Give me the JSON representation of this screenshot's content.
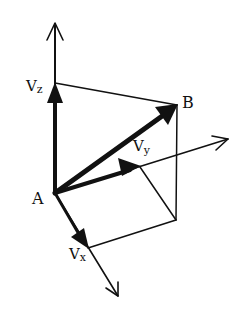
{
  "diagram": {
    "points": {
      "A": {
        "label": "A",
        "x": 55,
        "y": 193
      },
      "B": {
        "label": "B",
        "x": 177,
        "y": 105
      }
    },
    "labels": {
      "vz": {
        "main": "V",
        "sub": "z"
      },
      "vy": {
        "main": "V",
        "sub": "y"
      },
      "vx": {
        "main": "V",
        "sub": "x"
      },
      "A": "A",
      "B": "B"
    },
    "colors": {
      "stroke": "#111111",
      "background": "#ffffff"
    }
  }
}
